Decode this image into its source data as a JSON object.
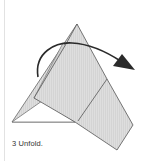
{
  "step": {
    "number": "3",
    "instruction": "Unfold.",
    "caption": "3 Unfold."
  },
  "diagram": {
    "action": "unfold flap",
    "arrow_direction": "clockwise, to the right",
    "colors": {
      "paper_fill": "#d6d6d6",
      "paper_fill_front": "#dcdcdc",
      "outline": "#555555",
      "arrow": "#2a2a2a",
      "border_rule": "#e2e2e2"
    }
  }
}
